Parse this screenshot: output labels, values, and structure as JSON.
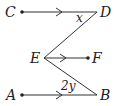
{
  "diagram": {
    "points": {
      "C": {
        "label": "C",
        "x": 22,
        "y": 12
      },
      "D": {
        "label": "D",
        "x": 97,
        "y": 12
      },
      "E": {
        "label": "E",
        "x": 44,
        "y": 58
      },
      "F": {
        "label": "F",
        "x": 88,
        "y": 58
      },
      "A": {
        "label": "A",
        "x": 22,
        "y": 95
      },
      "B": {
        "label": "B",
        "x": 97,
        "y": 95
      }
    },
    "angles": {
      "at_D": {
        "label": "x"
      },
      "at_B": {
        "label": "2y"
      }
    },
    "segments": [
      {
        "from": "C",
        "to": "D",
        "arrow": true
      },
      {
        "from": "D",
        "to": "E",
        "arrow": false
      },
      {
        "from": "E",
        "to": "F",
        "arrow": true
      },
      {
        "from": "E",
        "to": "B",
        "arrow": false
      },
      {
        "from": "A",
        "to": "B",
        "arrow": true
      }
    ],
    "colors": {
      "stroke": "#333333",
      "text": "#222222",
      "background": "#ffffff"
    }
  }
}
